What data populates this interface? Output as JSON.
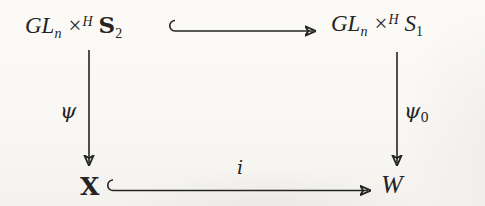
{
  "diagram": {
    "nodes": {
      "top_left": {
        "base": "GL",
        "base_sub": "n",
        "op": "×",
        "op_sup": "H",
        "set": "S",
        "set_sub": "2"
      },
      "top_right": {
        "base": "GL",
        "base_sub": "n",
        "op": "×",
        "op_sup": "H",
        "set": "S",
        "set_sub": "1"
      },
      "bottom_left": {
        "label": "X"
      },
      "bottom_right": {
        "label": "W"
      }
    },
    "arrows": {
      "top": {
        "type": "hook-right-arrow",
        "label": ""
      },
      "left": {
        "type": "down-arrow",
        "label": "ψ"
      },
      "right": {
        "type": "down-arrow",
        "label": "ψ",
        "label_sub": "0"
      },
      "bottom": {
        "type": "hook-right-arrow",
        "label": "i"
      }
    },
    "colors": {
      "ink": "#242424",
      "paper": "#f9f8f4"
    }
  }
}
